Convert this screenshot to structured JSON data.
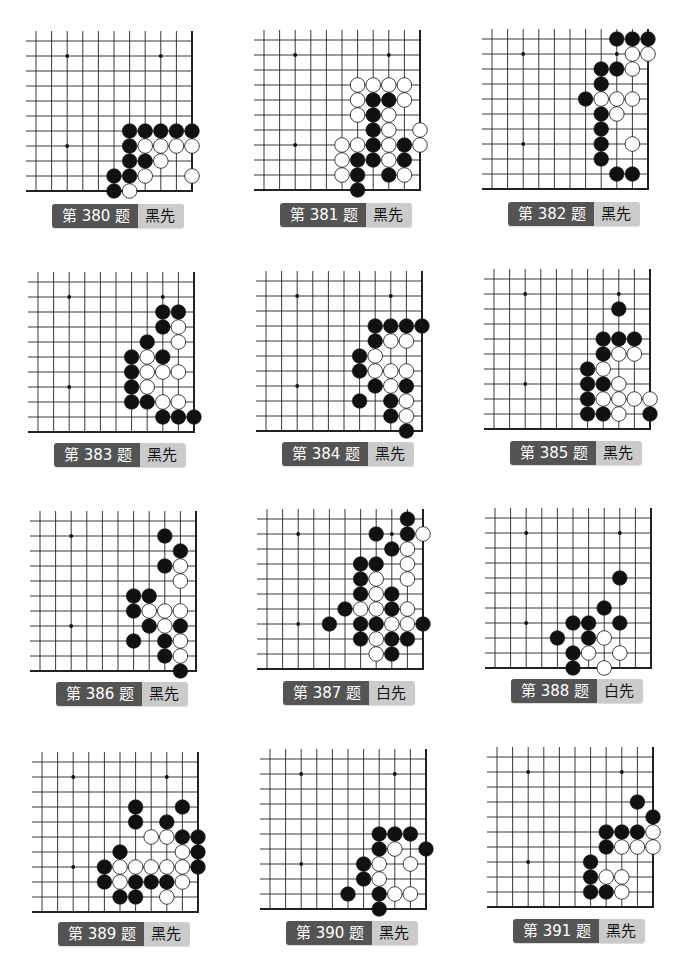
{
  "page": {
    "grid": {
      "cols": 11,
      "rows": 11,
      "star_points": [
        [
          2,
          1
        ],
        [
          8,
          1
        ],
        [
          2,
          7
        ]
      ]
    },
    "colors": {
      "label_dark": "#545454",
      "label_light": "#cbcbcb",
      "black": "#111111",
      "white": "#ffffff",
      "line": "#222222"
    }
  },
  "problems": [
    {
      "id": 380,
      "title": "第 380 题",
      "turn": "黑先",
      "origin": [
        36,
        41
      ],
      "label_pos": [
        52,
        204
      ],
      "black": [
        [
          6,
          6
        ],
        [
          7,
          6
        ],
        [
          8,
          6
        ],
        [
          9,
          6
        ],
        [
          10,
          6
        ],
        [
          6,
          7
        ],
        [
          6,
          8
        ],
        [
          7,
          8
        ],
        [
          6,
          9
        ],
        [
          5,
          9
        ],
        [
          5,
          10
        ]
      ],
      "white": [
        [
          7,
          7
        ],
        [
          8,
          7
        ],
        [
          9,
          7
        ],
        [
          10,
          7
        ],
        [
          8,
          8
        ],
        [
          7,
          9
        ],
        [
          10,
          9
        ],
        [
          6,
          10
        ]
      ]
    },
    {
      "id": 381,
      "title": "第 381 题",
      "turn": "黑先",
      "origin": [
        264,
        40
      ],
      "label_pos": [
        280,
        203
      ],
      "black": [
        [
          7,
          4
        ],
        [
          8,
          4
        ],
        [
          7,
          5
        ],
        [
          7,
          6
        ],
        [
          7,
          7
        ],
        [
          9,
          7
        ],
        [
          6,
          8
        ],
        [
          7,
          8
        ],
        [
          9,
          8
        ],
        [
          6,
          9
        ],
        [
          8,
          9
        ],
        [
          6,
          10
        ]
      ],
      "white": [
        [
          6,
          3
        ],
        [
          7,
          3
        ],
        [
          8,
          3
        ],
        [
          9,
          3
        ],
        [
          6,
          4
        ],
        [
          9,
          4
        ],
        [
          6,
          5
        ],
        [
          8,
          5
        ],
        [
          8,
          6
        ],
        [
          10,
          6
        ],
        [
          5,
          7
        ],
        [
          6,
          7
        ],
        [
          8,
          7
        ],
        [
          10,
          7
        ],
        [
          5,
          8
        ],
        [
          8,
          8
        ],
        [
          5,
          9
        ],
        [
          9,
          9
        ]
      ]
    },
    {
      "id": 382,
      "title": "第 382 题",
      "turn": "黑先",
      "origin": [
        492,
        39
      ],
      "label_pos": [
        508,
        202
      ],
      "black": [
        [
          8,
          0
        ],
        [
          9,
          0
        ],
        [
          10,
          0
        ],
        [
          7,
          2
        ],
        [
          8,
          2
        ],
        [
          7,
          3
        ],
        [
          6,
          4
        ],
        [
          7,
          5
        ],
        [
          7,
          6
        ],
        [
          7,
          7
        ],
        [
          7,
          8
        ],
        [
          8,
          9
        ],
        [
          9,
          9
        ]
      ],
      "white": [
        [
          9,
          1
        ],
        [
          10,
          1
        ],
        [
          9,
          2
        ],
        [
          7,
          4
        ],
        [
          8,
          4
        ],
        [
          9,
          4
        ],
        [
          8,
          5
        ],
        [
          9,
          7
        ]
      ]
    },
    {
      "id": 383,
      "title": "第 383 题",
      "turn": "黑先",
      "origin": [
        38,
        282
      ],
      "label_pos": [
        54,
        443
      ],
      "black": [
        [
          8,
          2
        ],
        [
          9,
          2
        ],
        [
          8,
          3
        ],
        [
          7,
          4
        ],
        [
          6,
          5
        ],
        [
          8,
          5
        ],
        [
          6,
          6
        ],
        [
          6,
          7
        ],
        [
          6,
          8
        ],
        [
          7,
          8
        ],
        [
          8,
          9
        ],
        [
          9,
          9
        ],
        [
          10,
          9
        ]
      ],
      "white": [
        [
          9,
          3
        ],
        [
          9,
          4
        ],
        [
          7,
          5
        ],
        [
          7,
          6
        ],
        [
          8,
          6
        ],
        [
          9,
          6
        ],
        [
          7,
          7
        ],
        [
          8,
          8
        ],
        [
          9,
          8
        ]
      ]
    },
    {
      "id": 384,
      "title": "第 384 题",
      "turn": "黑先",
      "origin": [
        266,
        281
      ],
      "label_pos": [
        282,
        442
      ],
      "black": [
        [
          7,
          3
        ],
        [
          8,
          3
        ],
        [
          9,
          3
        ],
        [
          10,
          3
        ],
        [
          7,
          4
        ],
        [
          6,
          5
        ],
        [
          6,
          6
        ],
        [
          7,
          7
        ],
        [
          9,
          7
        ],
        [
          6,
          8
        ],
        [
          8,
          8
        ],
        [
          8,
          9
        ],
        [
          9,
          10
        ]
      ],
      "white": [
        [
          8,
          4
        ],
        [
          9,
          4
        ],
        [
          7,
          5
        ],
        [
          7,
          6
        ],
        [
          8,
          6
        ],
        [
          9,
          6
        ],
        [
          8,
          7
        ],
        [
          9,
          8
        ],
        [
          9,
          9
        ]
      ]
    },
    {
      "id": 385,
      "title": "第 385 题",
      "turn": "黑先",
      "origin": [
        494,
        279
      ],
      "label_pos": [
        510,
        441
      ],
      "black": [
        [
          8,
          2
        ],
        [
          7,
          4
        ],
        [
          8,
          4
        ],
        [
          9,
          4
        ],
        [
          7,
          5
        ],
        [
          6,
          6
        ],
        [
          6,
          7
        ],
        [
          7,
          7
        ],
        [
          6,
          8
        ],
        [
          6,
          9
        ],
        [
          7,
          9
        ],
        [
          10,
          9
        ]
      ],
      "white": [
        [
          8,
          5
        ],
        [
          9,
          5
        ],
        [
          7,
          6
        ],
        [
          8,
          7
        ],
        [
          7,
          8
        ],
        [
          8,
          8
        ],
        [
          9,
          8
        ],
        [
          10,
          8
        ],
        [
          8,
          9
        ]
      ]
    },
    {
      "id": 386,
      "title": "第 386 题",
      "turn": "黑先",
      "origin": [
        40,
        521
      ],
      "label_pos": [
        56,
        682
      ],
      "black": [
        [
          8,
          1
        ],
        [
          9,
          2
        ],
        [
          8,
          3
        ],
        [
          6,
          5
        ],
        [
          7,
          5
        ],
        [
          6,
          6
        ],
        [
          7,
          7
        ],
        [
          9,
          7
        ],
        [
          6,
          8
        ],
        [
          8,
          8
        ],
        [
          8,
          9
        ],
        [
          9,
          10
        ]
      ],
      "white": [
        [
          9,
          3
        ],
        [
          9,
          4
        ],
        [
          7,
          6
        ],
        [
          8,
          6
        ],
        [
          9,
          6
        ],
        [
          8,
          7
        ],
        [
          9,
          8
        ],
        [
          9,
          9
        ]
      ]
    },
    {
      "id": 387,
      "title": "第 387 题",
      "turn": "白先",
      "origin": [
        267,
        519
      ],
      "label_pos": [
        283,
        681
      ],
      "black": [
        [
          9,
          0
        ],
        [
          7,
          1
        ],
        [
          9,
          1
        ],
        [
          8,
          2
        ],
        [
          6,
          3
        ],
        [
          7,
          3
        ],
        [
          6,
          4
        ],
        [
          6,
          5
        ],
        [
          8,
          5
        ],
        [
          5,
          6
        ],
        [
          8,
          6
        ],
        [
          4,
          7
        ],
        [
          6,
          7
        ],
        [
          7,
          7
        ],
        [
          10,
          7
        ],
        [
          6,
          8
        ],
        [
          8,
          8
        ],
        [
          9,
          8
        ],
        [
          8,
          9
        ]
      ],
      "white": [
        [
          10,
          1
        ],
        [
          9,
          2
        ],
        [
          9,
          3
        ],
        [
          7,
          4
        ],
        [
          9,
          4
        ],
        [
          7,
          5
        ],
        [
          6,
          6
        ],
        [
          7,
          6
        ],
        [
          9,
          6
        ],
        [
          8,
          7
        ],
        [
          9,
          7
        ],
        [
          7,
          8
        ],
        [
          7,
          9
        ]
      ]
    },
    {
      "id": 388,
      "title": "第 388 题",
      "turn": "白先",
      "origin": [
        495,
        518
      ],
      "label_pos": [
        511,
        679
      ],
      "black": [
        [
          8,
          4
        ],
        [
          7,
          6
        ],
        [
          5,
          7
        ],
        [
          6,
          7
        ],
        [
          8,
          7
        ],
        [
          4,
          8
        ],
        [
          6,
          8
        ],
        [
          5,
          9
        ],
        [
          5,
          10
        ]
      ],
      "white": [
        [
          7,
          8
        ],
        [
          6,
          9
        ],
        [
          8,
          9
        ],
        [
          7,
          10
        ]
      ]
    },
    {
      "id": 389,
      "title": "第 389 题",
      "turn": "黑先",
      "origin": [
        42,
        762
      ],
      "label_pos": [
        58,
        922
      ],
      "black": [
        [
          6,
          3
        ],
        [
          9,
          3
        ],
        [
          6,
          4
        ],
        [
          8,
          4
        ],
        [
          9,
          5
        ],
        [
          10,
          5
        ],
        [
          5,
          6
        ],
        [
          10,
          6
        ],
        [
          4,
          7
        ],
        [
          10,
          7
        ],
        [
          4,
          8
        ],
        [
          6,
          8
        ],
        [
          7,
          8
        ],
        [
          8,
          8
        ],
        [
          5,
          9
        ],
        [
          6,
          9
        ]
      ],
      "white": [
        [
          7,
          5
        ],
        [
          8,
          5
        ],
        [
          9,
          6
        ],
        [
          5,
          7
        ],
        [
          6,
          7
        ],
        [
          7,
          7
        ],
        [
          8,
          7
        ],
        [
          9,
          7
        ],
        [
          5,
          8
        ],
        [
          9,
          8
        ],
        [
          8,
          9
        ]
      ]
    },
    {
      "id": 390,
      "title": "第 390 题",
      "turn": "黑先",
      "origin": [
        270,
        759
      ],
      "label_pos": [
        286,
        921
      ],
      "black": [
        [
          7,
          5
        ],
        [
          8,
          5
        ],
        [
          9,
          5
        ],
        [
          7,
          6
        ],
        [
          10,
          6
        ],
        [
          6,
          7
        ],
        [
          6,
          8
        ],
        [
          5,
          9
        ],
        [
          7,
          9
        ],
        [
          7,
          10
        ]
      ],
      "white": [
        [
          8,
          6
        ],
        [
          7,
          7
        ],
        [
          9,
          7
        ],
        [
          7,
          8
        ],
        [
          8,
          9
        ],
        [
          9,
          9
        ]
      ]
    },
    {
      "id": 391,
      "title": "第 391 题",
      "turn": "黑先",
      "origin": [
        497,
        757
      ],
      "label_pos": [
        513,
        919
      ],
      "black": [
        [
          9,
          3
        ],
        [
          10,
          4
        ],
        [
          7,
          5
        ],
        [
          8,
          5
        ],
        [
          9,
          5
        ],
        [
          7,
          6
        ],
        [
          6,
          7
        ],
        [
          6,
          8
        ],
        [
          6,
          9
        ],
        [
          7,
          9
        ]
      ],
      "white": [
        [
          10,
          5
        ],
        [
          8,
          6
        ],
        [
          9,
          6
        ],
        [
          10,
          6
        ],
        [
          7,
          8
        ],
        [
          8,
          8
        ],
        [
          8,
          9
        ]
      ]
    }
  ]
}
